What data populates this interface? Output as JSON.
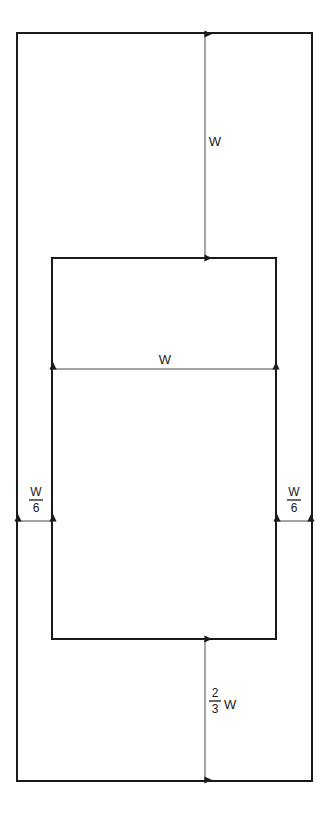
{
  "diagram": {
    "background_color": "#ffffff",
    "stroke_color": "#1a1a1a",
    "dimension_line_color": "#4d4d4d",
    "outer_rectangle": {
      "name": "outer-boundary-rectangle",
      "x": 17,
      "y": 33,
      "width": 295,
      "height": 748,
      "stroke_width": 2,
      "fill": "none"
    },
    "inner_rectangle": {
      "name": "inner-rectangle",
      "x": 52,
      "y": 258,
      "width": 224,
      "height": 381,
      "stroke_width": 2,
      "fill": "none"
    },
    "dimensions": [
      {
        "id": "top-gap",
        "name": "top-gap-dimension",
        "orientation": "vertical",
        "label": "W",
        "label_type": "plain",
        "label_x": 215,
        "label_y": 146,
        "line_x": 205,
        "from": 34,
        "to": 258
      },
      {
        "id": "inner-width",
        "name": "inner-width-dimension",
        "orientation": "horizontal",
        "label": "W",
        "label_type": "plain",
        "label_x": 165,
        "label_y": 364,
        "line_y": 369,
        "from": 53,
        "to": 276
      },
      {
        "id": "left-margin",
        "name": "left-margin-dimension",
        "orientation": "horizontal",
        "label_type": "fraction",
        "numerator": "W",
        "denominator": "6",
        "unit": "",
        "label_x": 36,
        "label_y": 496,
        "line_y": 521,
        "from": 18,
        "to": 53
      },
      {
        "id": "right-margin",
        "name": "right-margin-dimension",
        "orientation": "horizontal",
        "label_type": "fraction",
        "numerator": "W",
        "denominator": "6",
        "unit": "",
        "label_x": 294,
        "label_y": 496,
        "line_y": 521,
        "from": 277,
        "to": 311
      },
      {
        "id": "bottom-gap",
        "name": "bottom-gap-dimension",
        "orientation": "vertical",
        "label_type": "fraction",
        "numerator": "2",
        "denominator": "3",
        "unit": "W",
        "label_x": 215,
        "label_y": 697,
        "line_x": 205,
        "from": 639,
        "to": 780
      }
    ]
  }
}
